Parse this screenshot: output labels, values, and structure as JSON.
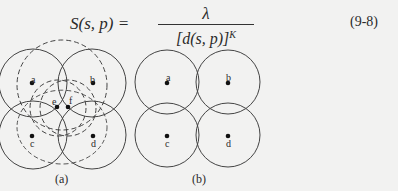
{
  "formula": {
    "lhs": "S(s, p) =",
    "numerator": "λ",
    "denominator": "[d(s, p)]",
    "exponent": "K",
    "equation_number": "(9-8)"
  },
  "figure_a": {
    "caption": "(a)",
    "point_labels": [
      "a",
      "b",
      "c",
      "d",
      "e",
      "f"
    ]
  },
  "figure_b": {
    "caption": "(b)",
    "point_labels": [
      "a",
      "b",
      "c",
      "d"
    ]
  }
}
